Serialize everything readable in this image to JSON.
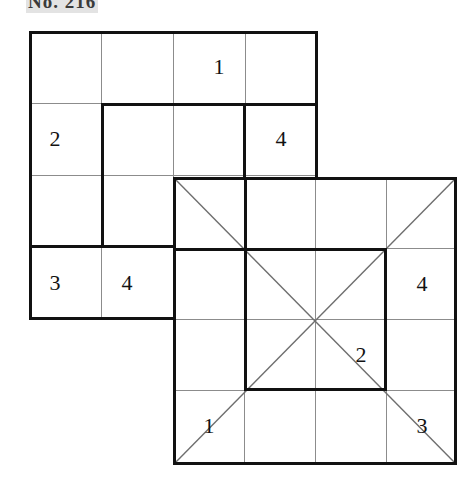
{
  "caption": {
    "label": "No. 216"
  },
  "figure": {
    "colors": {
      "heavy_line": "#111111",
      "thin_line": "#8c8c8c",
      "diagonal_line": "#6e6e6e",
      "background": "#ffffff",
      "caption_text": "#3a3a3a"
    },
    "cell_size_px": 72,
    "grids": [
      {
        "id": "top-grid",
        "name": "upper-left-grid",
        "rows": 4,
        "cols": 4,
        "origin_px": {
          "x": 29,
          "y": 31
        },
        "has_diagonals": false,
        "cage": {
          "row": 1,
          "col": 1,
          "rowspan": 2,
          "colspan": 2
        },
        "clues": [
          {
            "row": 0,
            "col": 2,
            "value": "1"
          },
          {
            "row": 1,
            "col": 0,
            "value": "2"
          },
          {
            "row": 1,
            "col": 3,
            "value": "4"
          },
          {
            "row": 2,
            "col": 3,
            "value": "3"
          },
          {
            "row": 3,
            "col": 0,
            "value": "3"
          },
          {
            "row": 3,
            "col": 1,
            "value": "4"
          }
        ]
      },
      {
        "id": "bottom-grid",
        "name": "lower-right-grid",
        "rows": 4,
        "cols": 4,
        "origin_px": {
          "x": 173,
          "y": 177
        },
        "has_diagonals": true,
        "cage": {
          "row": 1,
          "col": 1,
          "rowspan": 2,
          "colspan": 2
        },
        "clues": [
          {
            "row": 1,
            "col": 3,
            "value": "4"
          },
          {
            "row": 2,
            "col": 2,
            "value": "2"
          },
          {
            "row": 3,
            "col": 0,
            "value": "1"
          },
          {
            "row": 3,
            "col": 3,
            "value": "3"
          }
        ]
      }
    ]
  }
}
